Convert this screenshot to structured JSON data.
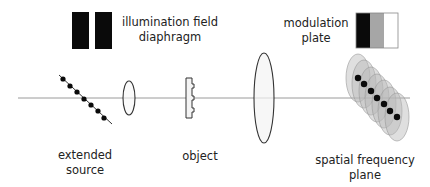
{
  "diagram": {
    "type": "optical-setup-schematic",
    "colors": {
      "axis": "#9a9a9a",
      "stroke": "#333333",
      "black": "#0a0a0a",
      "gray": "#a6a6a6",
      "lens_fill": "#f4f4f4",
      "ellipse_fill": "#b8b8b8"
    },
    "labels": {
      "illumination_line1": "illumination field",
      "illumination_line2": "diaphragm",
      "modulation_line1": "modulation",
      "modulation_line2": "plate",
      "source_line1": "extended",
      "source_line2": "source",
      "object": "object",
      "sfp_line1": "spatial frequency",
      "sfp_line2": "plane"
    },
    "components": [
      {
        "name": "extended source",
        "kind": "dotted diagonal line",
        "dots": 7
      },
      {
        "name": "condenser lens",
        "kind": "small ellipse"
      },
      {
        "name": "object",
        "kind": "phase object profile"
      },
      {
        "name": "objective lens",
        "kind": "large ellipse"
      },
      {
        "name": "spatial frequency plane",
        "kind": "overlapping ellipses with dots",
        "ellipses": 7,
        "dots": 7
      },
      {
        "name": "illumination field diaphragm",
        "kind": "two black rectangles"
      },
      {
        "name": "modulation plate",
        "kind": "three-band rectangle",
        "bands": [
          "black",
          "gray",
          "white"
        ]
      }
    ]
  }
}
